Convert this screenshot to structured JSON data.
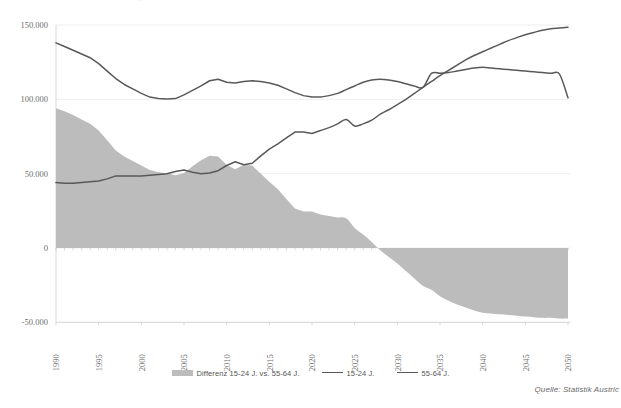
{
  "title_clipped": "Arbeitsmarkt: Jüngere und Ältere Erwerbspersonen",
  "source_note": "Quelle: Statistik Austric",
  "legend": {
    "items": [
      {
        "label": "Differenz 15-24 J. vs. 55-64 J.",
        "type": "area",
        "color": "#bcbcbc",
        "name": "legend-item-differenz"
      },
      {
        "label": "15-24 J.",
        "type": "line",
        "color": "#595959",
        "name": "legend-item-15-24"
      },
      {
        "label": "55-64 J.",
        "type": "line",
        "color": "#595959",
        "name": "legend-item-55-64"
      }
    ]
  },
  "chart_data": {
    "type": "area",
    "title": "",
    "xlabel": "",
    "ylabel": "",
    "xlim": [
      1990,
      2050
    ],
    "ylim": [
      -50000,
      150000
    ],
    "yticks": [
      150000,
      100000,
      50000,
      0,
      -50000
    ],
    "ytick_labels": [
      "150.000",
      "100.000",
      "50.000",
      "0",
      "-50.000"
    ],
    "xticks": [
      1990,
      1995,
      2000,
      2005,
      2010,
      2015,
      2020,
      2025,
      2030,
      2035,
      2040,
      2045,
      2050
    ],
    "xtick_labels": [
      "1990",
      "1995",
      "2000",
      "2005",
      "2010",
      "2015",
      "2020",
      "2025",
      "2030",
      "2035",
      "2040",
      "2045",
      "2050"
    ],
    "grid": true,
    "legend_position": "bottom",
    "x": [
      1990,
      1991,
      1992,
      1993,
      1994,
      1995,
      1996,
      1997,
      1998,
      1999,
      2000,
      2001,
      2002,
      2003,
      2004,
      2005,
      2006,
      2007,
      2008,
      2009,
      2010,
      2011,
      2012,
      2013,
      2014,
      2015,
      2016,
      2017,
      2018,
      2019,
      2020,
      2021,
      2022,
      2023,
      2024,
      2025,
      2026,
      2027,
      2028,
      2029,
      2030,
      2031,
      2032,
      2033,
      2034,
      2035,
      2036,
      2037,
      2038,
      2039,
      2040,
      2041,
      2042,
      2043,
      2044,
      2045,
      2046,
      2047,
      2048,
      2049,
      2050
    ],
    "series": [
      {
        "name": "55-64 J.",
        "type": "line",
        "color": "#595959",
        "values": [
          138000,
          135500,
          133000,
          130500,
          128000,
          124000,
          119000,
          114000,
          110000,
          107000,
          104000,
          101500,
          100500,
          100300,
          100500,
          103000,
          106000,
          109000,
          112500,
          113500,
          111500,
          111000,
          112000,
          112500,
          112000,
          111000,
          109500,
          107000,
          104500,
          102500,
          101500,
          101500,
          102500,
          104000,
          106500,
          109000,
          111500,
          113000,
          113500,
          113000,
          112000,
          110500,
          109000,
          108000,
          117500,
          117500,
          118000,
          119000,
          120000,
          121000,
          121500,
          121000,
          120500,
          120000,
          119500,
          119000,
          118500,
          118000,
          117500,
          117000,
          101000
        ]
      },
      {
        "name": "15-24 J.",
        "type": "line",
        "color": "#595959",
        "values": [
          44000,
          43500,
          43500,
          44000,
          44500,
          45000,
          46500,
          48500,
          48500,
          48500,
          48500,
          49000,
          49500,
          50000,
          51500,
          52500,
          51000,
          50000,
          50500,
          52000,
          55500,
          58000,
          56000,
          57000,
          62000,
          66500,
          70000,
          74000,
          78000,
          78000,
          77000,
          79000,
          81000,
          83500,
          86500,
          82000,
          83500,
          86000,
          90000,
          93000,
          96500,
          100000,
          104000,
          108000,
          112000,
          116000,
          119500,
          123000,
          126500,
          129500,
          132000,
          134500,
          137000,
          139500,
          141500,
          143500,
          145000,
          146500,
          147500,
          148000,
          148500
        ]
      },
      {
        "name": "Differenz 15-24 J. vs. 55-64 J.",
        "type": "area",
        "color": "#bcbcbc",
        "values": [
          94000,
          92000,
          89500,
          86500,
          83500,
          79000,
          72500,
          65500,
          61500,
          58500,
          55500,
          52500,
          51000,
          50300,
          49000,
          50500,
          55000,
          59000,
          62000,
          61500,
          56000,
          53000,
          56000,
          55500,
          50000,
          44500,
          39500,
          33000,
          26500,
          24500,
          24500,
          22500,
          21500,
          20500,
          20000,
          13500,
          9000,
          4000,
          -1500,
          -6000,
          -10500,
          -15500,
          -20500,
          -25500,
          -28000,
          -32500,
          -35500,
          -38000,
          -40000,
          -42000,
          -43500,
          -44000,
          -44500,
          -45000,
          -45500,
          -46000,
          -46500,
          -47000,
          -47000,
          -47500,
          -47500
        ]
      }
    ]
  },
  "axis_pixels": {
    "plot_left": 56,
    "plot_right": 568,
    "y_150000": 25,
    "y_0": 248,
    "y_neg50000": 324
  }
}
